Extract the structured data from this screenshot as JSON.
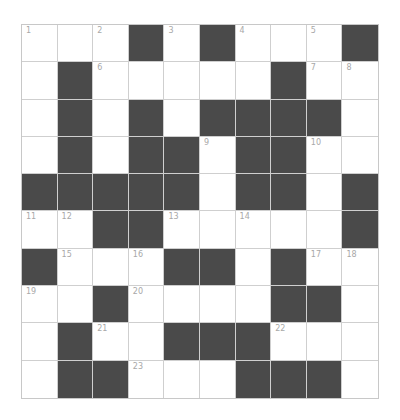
{
  "puzzle": {
    "rows": 10,
    "cols": 10,
    "colors": {
      "block": "#4a4a4a",
      "open": "#ffffff",
      "gridline": "#cfcfcf",
      "number": "#a8a8a8"
    },
    "grid": [
      [
        "1",
        ".",
        "2",
        "#",
        "3",
        "#",
        "4",
        ".",
        "5",
        "#"
      ],
      [
        ".",
        "#",
        "6",
        ".",
        ".",
        ".",
        ".",
        "#",
        "7",
        "8"
      ],
      [
        ".",
        "#",
        ".",
        "#",
        ".",
        "#",
        "#",
        "#",
        "#",
        "."
      ],
      [
        ".",
        "#",
        ".",
        "#",
        "#",
        "9",
        "#",
        "#",
        "10",
        "."
      ],
      [
        "#",
        "#",
        "#",
        "#",
        "#",
        ".",
        "#",
        "#",
        ".",
        "#"
      ],
      [
        "11",
        "12",
        "#",
        "#",
        "13",
        ".",
        "14",
        ".",
        ".",
        "#"
      ],
      [
        "#",
        "15",
        ".",
        "16",
        "#",
        "#",
        ".",
        "#",
        "17",
        "18"
      ],
      [
        "19",
        ".",
        "#",
        "20",
        ".",
        ".",
        ".",
        "#",
        "#",
        "."
      ],
      [
        ".",
        "#",
        "21",
        ".",
        "#",
        "#",
        "#",
        "22",
        ".",
        "."
      ],
      [
        ".",
        "#",
        "#",
        "23",
        ".",
        ".",
        "#",
        "#",
        "#",
        "."
      ]
    ]
  }
}
